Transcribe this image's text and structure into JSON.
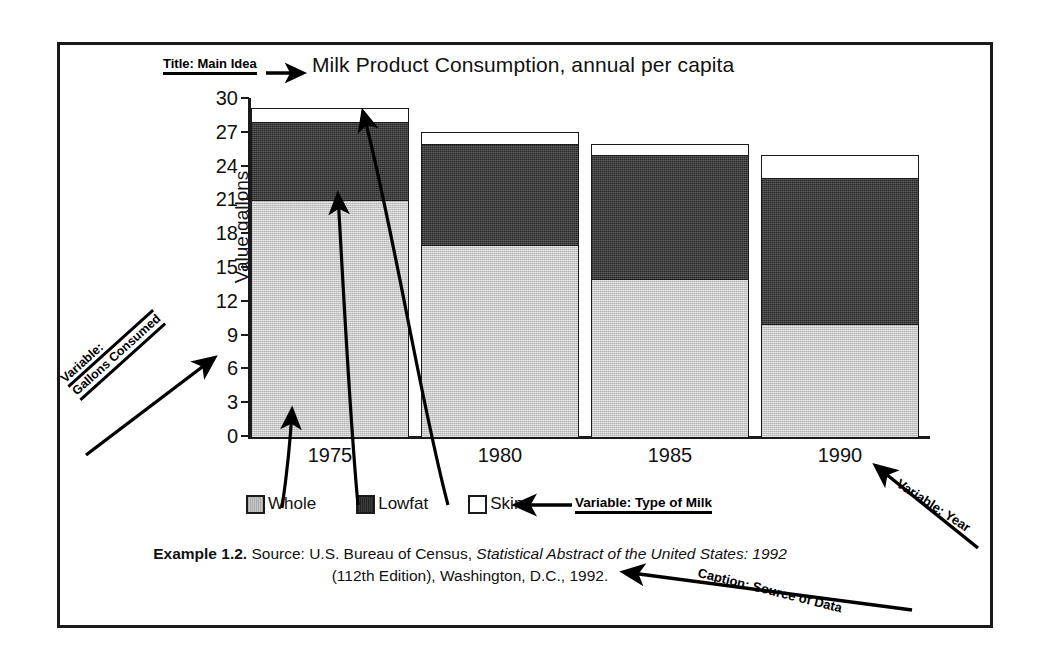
{
  "chart_data": {
    "type": "bar",
    "subtype": "stacked-bar",
    "title": "Milk Product Consumption, annual per capita",
    "xlabel": "",
    "ylabel": "Value gallons",
    "categories": [
      "1975",
      "1980",
      "1985",
      "1990"
    ],
    "ylim": [
      0,
      30
    ],
    "yticks": [
      0,
      3,
      6,
      9,
      12,
      15,
      18,
      21,
      24,
      27,
      30
    ],
    "grid": false,
    "legend_position": "bottom",
    "series": [
      {
        "name": "Whole",
        "values": [
          21,
          17,
          14,
          10
        ],
        "color": "#c6c6c6"
      },
      {
        "name": "Lowfat",
        "values": [
          7,
          9,
          11,
          13
        ],
        "color": "#3d3d3d"
      },
      {
        "name": "Skim",
        "values": [
          1.2,
          1,
          1,
          2
        ],
        "color": "#ffffff"
      }
    ],
    "cumulative_tops": [
      [
        21,
        28,
        29.2
      ],
      [
        17,
        26,
        27
      ],
      [
        14,
        25,
        26
      ],
      [
        10,
        23,
        25
      ]
    ]
  },
  "annotations": {
    "title_callout": "Title: Main Idea",
    "y_variable_callout_line1": "Variable:",
    "y_variable_callout_line2": "Gallons Consumed",
    "milk_type_callout": "Variable: Type of Milk",
    "year_callout": "Variable: Year",
    "caption_callout": "Caption: Source of Data"
  },
  "legend": {
    "items": [
      {
        "label": "Whole",
        "swatch": "whole"
      },
      {
        "label": "Lowfat",
        "swatch": "lowfat"
      },
      {
        "label": "Skim",
        "swatch": "skim"
      }
    ]
  },
  "caption": {
    "example_label": "Example 1.2.",
    "source_prefix": " Source: U.S. Bureau of Census, ",
    "source_italic": "Statistical Abstract of the United States: 1992",
    "source_suffix": " (112th Edition), Washington, D.C., 1992."
  },
  "colors": {
    "whole": "#c6c6c6",
    "lowfat": "#3d3d3d",
    "skim": "#ffffff",
    "ink": "#1a1a1a",
    "background": "#ffffff"
  }
}
